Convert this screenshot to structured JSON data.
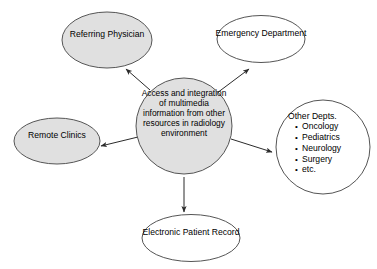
{
  "diagram": {
    "type": "hub-and-spoke",
    "title": "Access and integration of multimedia information from other resources in radiology environment",
    "colors": {
      "gray_fill": "#e0e0e0",
      "white_fill": "#ffffff",
      "stroke": "#555555",
      "arrow": "#333333",
      "text": "#000000"
    },
    "center": {
      "id": "center-hub",
      "shape": "circle",
      "fill": "#e0e0e0",
      "lines": [
        "Access and",
        "integration of",
        "multimedia",
        "information from",
        "other resources in",
        "radiology",
        "environment"
      ],
      "text": "Access and integration of multimedia information from other resources in radiology environment"
    },
    "nodes": [
      {
        "id": "referring-physician",
        "shape": "ellipse",
        "fill": "#e0e0e0",
        "lines": [
          "Referring",
          "Physician"
        ],
        "text": "Referring Physician"
      },
      {
        "id": "emergency-department",
        "shape": "ellipse",
        "fill": "#ffffff",
        "lines": [
          "Emergency",
          "Department"
        ],
        "text": "Emergency Department"
      },
      {
        "id": "other-depts",
        "shape": "circle",
        "fill": "#ffffff",
        "title": "Other Depts.",
        "items": [
          "Oncology",
          "Pediatrics",
          "Neurology",
          "Surgery",
          "etc."
        ]
      },
      {
        "id": "remote-clinics",
        "shape": "ellipse",
        "fill": "#e0e0e0",
        "lines": [
          "Remote",
          "Clinics"
        ],
        "text": "Remote Clinics"
      },
      {
        "id": "electronic-patient-record",
        "shape": "ellipse",
        "fill": "#ffffff",
        "lines": [
          "Electronic",
          "Patient Record"
        ],
        "text": "Electronic Patient Record"
      }
    ],
    "connectors": [
      {
        "id": "arrow-to-referring-physician",
        "from": "center-hub",
        "to": "referring-physician",
        "direction": "up-left"
      },
      {
        "id": "arrow-to-emergency-department",
        "from": "center-hub",
        "to": "emergency-department",
        "direction": "up-right"
      },
      {
        "id": "arrow-to-other-depts",
        "from": "center-hub",
        "to": "other-depts",
        "direction": "right-down"
      },
      {
        "id": "arrow-to-remote-clinics",
        "from": "center-hub",
        "to": "remote-clinics",
        "direction": "left-down"
      },
      {
        "id": "arrow-to-electronic-patient-record",
        "from": "center-hub",
        "to": "electronic-patient-record",
        "direction": "down"
      }
    ]
  }
}
